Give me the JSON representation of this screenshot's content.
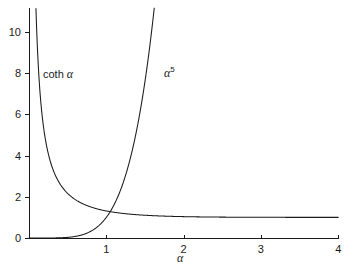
{
  "chart_data": {
    "type": "line",
    "title": "",
    "subtitle": "",
    "xlabel": "α",
    "ylabel": "",
    "xlim": [
      0,
      4
    ],
    "ylim": [
      0,
      11
    ],
    "grid": false,
    "legend_position": "inline-annotations",
    "background_color": "#ffffff",
    "line_color": "#1a1a1a",
    "xticks": [
      {
        "value": 1,
        "label": "1"
      },
      {
        "value": 2,
        "label": "2"
      },
      {
        "value": 3,
        "label": "3"
      },
      {
        "value": 4,
        "label": "4"
      }
    ],
    "yticks": [
      {
        "value": 0,
        "label": "0"
      },
      {
        "value": 2,
        "label": "2"
      },
      {
        "value": 4,
        "label": "4"
      },
      {
        "value": 6,
        "label": "6"
      },
      {
        "value": 8,
        "label": "8"
      },
      {
        "value": 10,
        "label": "10"
      }
    ],
    "annotations": [
      {
        "id": "coth-label",
        "text": "coth α",
        "x": 0.25,
        "y": 7.9
      },
      {
        "id": "alpha5-label",
        "text": "α⁵",
        "x": 1.65,
        "y": 8.1
      }
    ],
    "series": [
      {
        "name": "coth α",
        "formula": "coth(alpha)",
        "x": [
          0.09,
          0.1,
          0.12,
          0.14,
          0.16,
          0.18,
          0.2,
          0.24,
          0.28,
          0.32,
          0.36,
          0.4,
          0.45,
          0.5,
          0.55,
          0.6,
          0.65,
          0.7,
          0.8,
          0.9,
          1.0,
          1.1,
          1.2,
          1.3,
          1.4,
          1.5,
          1.6,
          1.8,
          2.0,
          2.25,
          2.5,
          2.75,
          3.0,
          3.25,
          3.5,
          3.75,
          4.0
        ],
        "y": [
          11.14,
          10.03,
          8.37,
          7.18,
          6.29,
          5.6,
          5.07,
          4.27,
          3.7,
          3.28,
          2.95,
          2.7,
          2.45,
          2.26,
          2.11,
          1.99,
          1.89,
          1.8,
          1.67,
          1.58,
          1.31,
          1.23,
          1.2,
          1.16,
          1.13,
          1.1,
          1.08,
          1.05,
          1.04,
          1.02,
          1.01,
          1.01,
          1.0,
          1.0,
          1.0,
          1.0,
          1.0
        ]
      },
      {
        "name": "α⁵",
        "formula": "alpha^5",
        "x": [
          0.0,
          0.1,
          0.2,
          0.3,
          0.4,
          0.5,
          0.55,
          0.6,
          0.65,
          0.7,
          0.75,
          0.8,
          0.85,
          0.9,
          0.95,
          1.0,
          1.05,
          1.1,
          1.15,
          1.2,
          1.25,
          1.3,
          1.35,
          1.4,
          1.45,
          1.5,
          1.55,
          1.6,
          1.62
        ],
        "y": [
          0.0,
          1e-05,
          0.0003,
          0.0024,
          0.0102,
          0.031,
          0.05,
          0.078,
          0.116,
          0.168,
          0.237,
          0.328,
          0.444,
          0.59,
          0.774,
          1.0,
          1.28,
          1.61,
          2.01,
          2.49,
          3.05,
          3.71,
          4.49,
          5.38,
          6.41,
          7.59,
          8.95,
          10.49,
          11.15
        ]
      }
    ]
  },
  "geometry": {
    "origin_x_px": 29,
    "origin_y_px": 238,
    "x_scale_px_per_unit": 77.3,
    "y_scale_px_per_unit": 20.6
  }
}
